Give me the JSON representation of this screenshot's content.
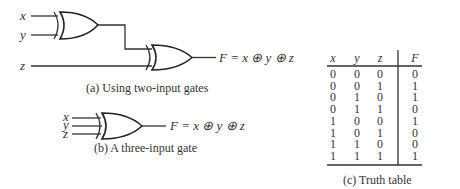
{
  "diagram_a": {
    "inputs": [
      "x",
      "y",
      "z"
    ],
    "output_label": "F = x ⊕ y ⊕ z",
    "caption": "(a) Using two-input gates"
  },
  "diagram_b": {
    "inputs": [
      "x",
      "y",
      "z"
    ],
    "output_label": "F = x ⊕ y ⊕ z",
    "caption": "(b) A three-input gate"
  },
  "truth_table": {
    "headers": [
      "x",
      "y",
      "z",
      "F"
    ],
    "rows": [
      [
        "0",
        "0",
        "0",
        "0"
      ],
      [
        "0",
        "0",
        "1",
        "1"
      ],
      [
        "0",
        "1",
        "0",
        "1"
      ],
      [
        "0",
        "1",
        "1",
        "0"
      ],
      [
        "1",
        "0",
        "0",
        "1"
      ],
      [
        "1",
        "0",
        "1",
        "0"
      ],
      [
        "1",
        "1",
        "0",
        "0"
      ],
      [
        "1",
        "1",
        "1",
        "1"
      ]
    ],
    "caption": "(c) Truth table"
  }
}
